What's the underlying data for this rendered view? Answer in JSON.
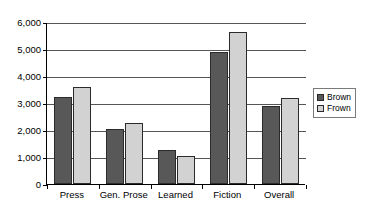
{
  "chart_data": {
    "type": "bar",
    "title": "",
    "subtitle": "",
    "xlabel": "",
    "ylabel": "",
    "categories": [
      "Press",
      "Gen. Prose",
      "Learned",
      "Fiction",
      "Overall"
    ],
    "series": [
      {
        "name": "Brown",
        "color": "#585858",
        "values": [
          3220,
          2050,
          1250,
          4880,
          2890
        ]
      },
      {
        "name": "Frown",
        "color": "#d2d2d2",
        "values": [
          3600,
          2250,
          1020,
          5630,
          3180
        ]
      }
    ],
    "ylim": [
      0,
      6000
    ],
    "ytick_values": [
      0,
      1000,
      2000,
      3000,
      4000,
      5000,
      6000
    ],
    "ytick_labels": [
      "0",
      "1,000",
      "2,000",
      "3,000",
      "4,000",
      "5,000",
      "6,000"
    ],
    "grid": true,
    "grid_axis": "y",
    "legend_position": "right",
    "legend_entries": [
      "Brown",
      "Frown"
    ],
    "annotations": []
  },
  "legend": {
    "entries": [
      {
        "label": "Brown",
        "swatch": "filled-dark-square-icon"
      },
      {
        "label": "Frown",
        "swatch": "outlined-light-square-icon"
      }
    ]
  }
}
